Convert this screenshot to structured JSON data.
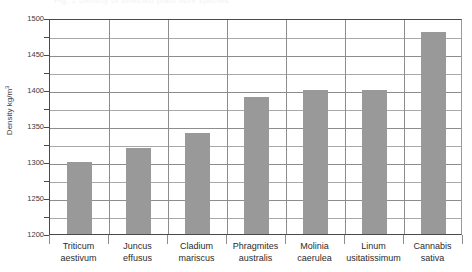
{
  "figure": {
    "top_fragment": "Fig. 1  Density of selected plant fibre species",
    "bar_color": "#999999",
    "grid_color": "#8d8d8d",
    "axis_color": "#4a4a4a"
  },
  "chart_data": {
    "type": "bar",
    "title": "",
    "xlabel": "",
    "ylabel": "Density kg/m",
    "ylabel_superscript": "3",
    "ylim": [
      1200,
      1500
    ],
    "ytick_step": 50,
    "gridline_step": 25,
    "yticks": [
      1200,
      1250,
      1300,
      1350,
      1400,
      1450,
      1500
    ],
    "ytick_labels": [
      "1200",
      "1250",
      "1300",
      "1350",
      "1400",
      "1450",
      "1500"
    ],
    "gridlines": [
      1200,
      1225,
      1250,
      1275,
      1300,
      1325,
      1350,
      1375,
      1400,
      1425,
      1450,
      1475,
      1500
    ],
    "grid": true,
    "legend": "none",
    "categories": [
      "Triticum aestivum",
      "Juncus effusus",
      "Cladium mariscus",
      "Phragmites australis",
      "Molinia caerulea",
      "Linum usitatissimum",
      "Cannabis sativa"
    ],
    "category_lines": [
      [
        "Triticum",
        "aestivum"
      ],
      [
        "Juncus",
        "effusus"
      ],
      [
        "Cladium",
        "mariscus"
      ],
      [
        "Phragmites",
        "australis"
      ],
      [
        "Molinia",
        "caerulea"
      ],
      [
        "Linum",
        "usitatissimum"
      ],
      [
        "Cannabis",
        "sativa"
      ]
    ],
    "values": [
      1300,
      1320,
      1340,
      1390,
      1400,
      1400,
      1480
    ]
  }
}
